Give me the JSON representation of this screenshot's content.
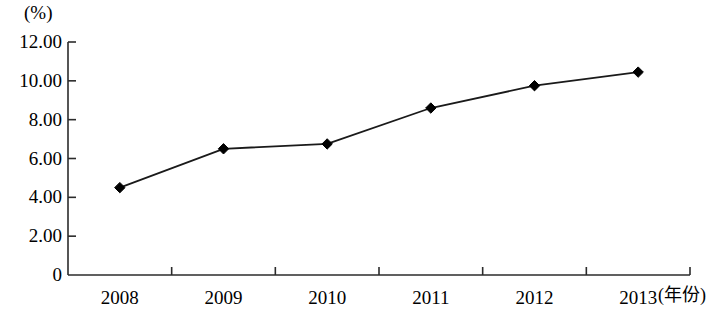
{
  "chart_data": {
    "type": "line",
    "title": "",
    "subtitle": "",
    "xlabel": "(年份)",
    "ylabel": "(%)",
    "categories": [
      "2008",
      "2009",
      "2010",
      "2011",
      "2012",
      "2013"
    ],
    "values": [
      4.5,
      6.5,
      6.75,
      8.6,
      9.75,
      10.45
    ],
    "series": [
      {
        "name": "",
        "values": [
          4.5,
          6.5,
          6.75,
          8.6,
          9.75,
          10.45
        ]
      }
    ],
    "ylim": [
      0,
      12
    ],
    "xlim": [
      0,
      6
    ],
    "y_tick_labels": [
      "0",
      "2.00",
      "4.00",
      "6.00",
      "8.00",
      "10.00",
      "12.00"
    ],
    "y_tick_values": [
      0,
      2,
      4,
      6,
      8,
      10,
      12
    ],
    "x_tick_labels": [
      "2008",
      "2009",
      "2010",
      "2011",
      "2012",
      "2013"
    ],
    "grid": false,
    "legend": false,
    "legend_position": "none",
    "marker": "diamond",
    "line_color": "#1a1a1a",
    "marker_color": "#000000",
    "axis_color": "#2b2b2b",
    "background_color": "#ffffff"
  },
  "axis": {
    "y_unit_label": "(%)",
    "x_axis_title": "(年份)"
  }
}
